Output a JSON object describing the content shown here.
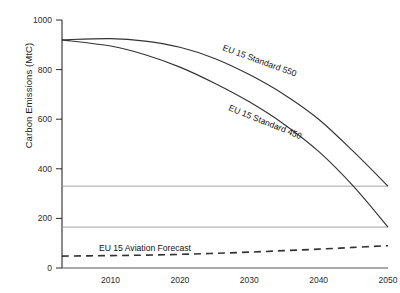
{
  "chart_data": {
    "type": "line",
    "title": "",
    "xlabel": "",
    "ylabel": "Carbon Emissions (MtC)",
    "xlim": [
      2003,
      2050
    ],
    "ylim": [
      0,
      1000
    ],
    "grid": false,
    "legend_position": "inline-annotations",
    "x_ticks": [
      "2010",
      "2020",
      "2030",
      "2040",
      "2050"
    ],
    "x_tick_values": [
      2010,
      2020,
      2030,
      2040,
      2050
    ],
    "y_ticks": [
      "0",
      "200",
      "400",
      "600",
      "800",
      "1000"
    ],
    "y_tick_values": [
      0,
      200,
      400,
      600,
      800,
      1000
    ],
    "x": [
      2003,
      2010,
      2015,
      2020,
      2025,
      2030,
      2035,
      2040,
      2045,
      2050
    ],
    "series": [
      {
        "name": "EU 15 Standard 550",
        "style": "solid",
        "color": "#333333",
        "values": [
          920,
          925,
          915,
          890,
          845,
          780,
          700,
          600,
          470,
          330
        ],
        "label_text": "EU 15 Standard 550",
        "label_rotation_deg": 20
      },
      {
        "name": "EU 15 Standard 450",
        "style": "solid",
        "color": "#333333",
        "values": [
          920,
          895,
          860,
          810,
          745,
          670,
          580,
          470,
          330,
          165
        ],
        "label_text": "EU 15 Standard 450",
        "label_rotation_deg": 22
      },
      {
        "name": "EU 15 Aviation Forecast",
        "style": "dashed",
        "color": "#333333",
        "values": [
          48,
          50,
          52,
          55,
          59,
          64,
          70,
          76,
          83,
          90
        ],
        "label_text": "EU 15 Aviation Forecast",
        "label_rotation_deg": 0
      }
    ],
    "reference_lines": [
      {
        "name": "upper-reference-line",
        "value": 330,
        "color": "#9a9a9a"
      },
      {
        "name": "lower-reference-line",
        "value": 165,
        "color": "#9a9a9a"
      }
    ],
    "annotations": [
      {
        "name": "label-standard-550",
        "text": "EU 15 Standard 550"
      },
      {
        "name": "label-standard-450",
        "text": "EU 15 Standard 450"
      },
      {
        "name": "label-aviation-forecast",
        "text": "EU 15 Aviation Forecast"
      }
    ]
  }
}
